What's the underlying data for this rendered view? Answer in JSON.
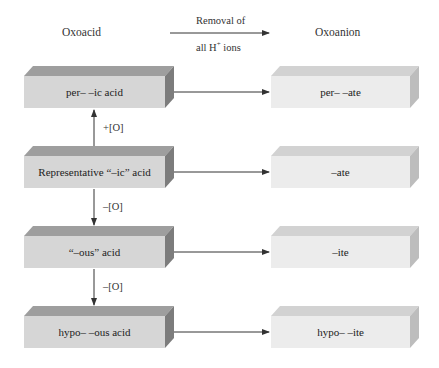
{
  "headers": {
    "left": "Oxoacid",
    "right": "Oxoanion",
    "arrow_label_line1": "Removal of",
    "arrow_label_line2_prefix": "all H",
    "arrow_label_line2_sup": "+",
    "arrow_label_line2_suffix": " ions"
  },
  "rows": [
    {
      "acid": "per– –ic acid",
      "anion": "per– –ate"
    },
    {
      "acid": "Representative “–ic” acid",
      "anion": "–ate"
    },
    {
      "acid": "“–ous” acid",
      "anion": "–ite"
    },
    {
      "acid": "hypo– –ous acid",
      "anion": "hypo– –ite"
    }
  ],
  "vertical_arrows": [
    {
      "label": "+[O]",
      "direction": "up",
      "from_row": 1,
      "to_row": 0
    },
    {
      "label": "–[O]",
      "direction": "down",
      "from_row": 1,
      "to_row": 2
    },
    {
      "label": "–[O]",
      "direction": "down",
      "from_row": 2,
      "to_row": 3
    }
  ],
  "colors": {
    "acid_front": "#d6d6d6",
    "acid_top": "#9e9e9e",
    "acid_side": "#7c7c7c",
    "anion_front": "#ececec",
    "anion_top": "#d2d2d2",
    "anion_side": "#bdbdbd",
    "arrow": "#333333"
  }
}
